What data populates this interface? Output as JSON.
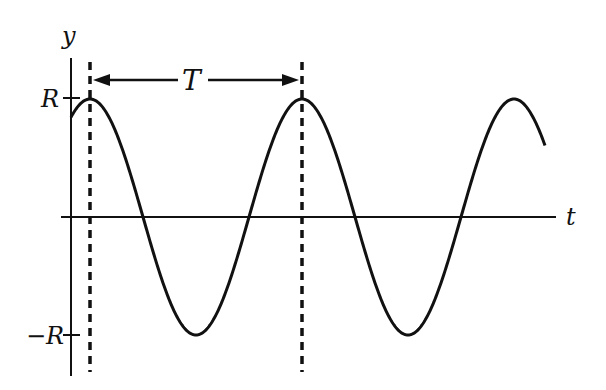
{
  "diagram": {
    "type": "sinusoid",
    "labels": {
      "y_axis": "y",
      "x_axis": "t",
      "amplitude_pos": "R",
      "amplitude_neg": "−R",
      "period": "T"
    },
    "colors": {
      "line": "#111111",
      "background": "#ffffff"
    },
    "geometry": {
      "origin_x": 71,
      "axis_y": 217,
      "amplitude_px": 118,
      "period_px": 212,
      "first_peak_x": 90,
      "start_x": 71,
      "end_x": 545,
      "period_marker_x1": 90,
      "period_marker_x2": 302
    }
  }
}
